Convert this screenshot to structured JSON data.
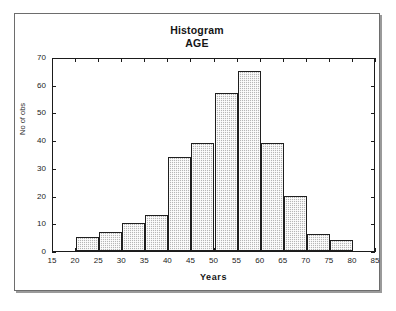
{
  "chart_data": {
    "type": "bar",
    "title": "Histogram",
    "subtitle": "AGE",
    "xlabel": "Years",
    "ylabel": "No of obs",
    "xlim": [
      15,
      85
    ],
    "ylim": [
      0,
      70
    ],
    "xticks": [
      15,
      20,
      25,
      30,
      35,
      40,
      45,
      50,
      55,
      60,
      65,
      70,
      75,
      80,
      85
    ],
    "yticks": [
      0,
      10,
      20,
      30,
      40,
      50,
      60,
      70
    ],
    "grid": false,
    "legend": null,
    "bin_width": 5,
    "categories": [
      "20-25",
      "25-30",
      "30-35",
      "35-40",
      "40-45",
      "45-50",
      "50-55",
      "55-60",
      "60-65",
      "65-70",
      "70-75",
      "75-80"
    ],
    "bin_starts": [
      20,
      25,
      30,
      35,
      40,
      45,
      50,
      55,
      60,
      65,
      70,
      75
    ],
    "values": [
      5,
      7,
      10,
      13,
      34,
      39,
      57,
      65,
      39,
      20,
      6,
      4
    ],
    "bar_fill_color": "#b6b6b6",
    "bar_edge_color": "#1f1f1f",
    "axis_color": "#1b1b1b",
    "frame_color": "#6d6d6d",
    "background_color": "#ffffff"
  }
}
